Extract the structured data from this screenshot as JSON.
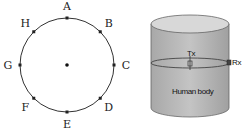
{
  "left_diagram": {
    "type": "circle-with-points",
    "points": [
      {
        "label": "A",
        "angle": 90
      },
      {
        "label": "B",
        "angle": 45
      },
      {
        "label": "C",
        "angle": 0
      },
      {
        "label": "D",
        "angle": -45
      },
      {
        "label": "E",
        "angle": -90
      },
      {
        "label": "F",
        "angle": -135
      },
      {
        "label": "G",
        "angle": 180
      },
      {
        "label": "H",
        "angle": 135
      }
    ]
  },
  "right_diagram": {
    "type": "cylinder",
    "tx_label": "Tx",
    "rx_label": "Rx",
    "body_label": "Human body",
    "colors": {
      "fill": "#b8b8b8",
      "top": "#d6d6d6",
      "stroke": "#555555"
    }
  }
}
